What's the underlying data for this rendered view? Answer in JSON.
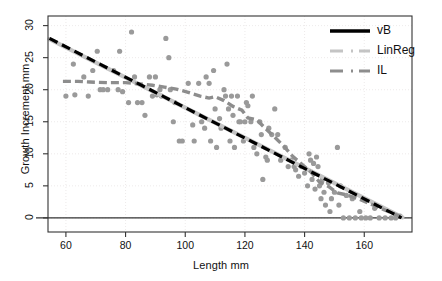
{
  "chart_data": {
    "type": "scatter",
    "title": "",
    "xlabel": "Length mm",
    "ylabel": "Growth Increment mm",
    "xlim": [
      54,
      176
    ],
    "ylim": [
      -2.2,
      31.5
    ],
    "xticks": [
      60,
      80,
      100,
      120,
      140,
      160
    ],
    "yticks": [
      0,
      5,
      10,
      15,
      20,
      25,
      30
    ],
    "grid": true,
    "grid_color": "#e8e4e4",
    "legend_position": "top-right",
    "zero_line": 0,
    "point_color": "#9a9a9a",
    "point_radius": 2.6,
    "legend": [
      {
        "name": "vB",
        "color": "#000000",
        "style": "solid",
        "width": 3.4
      },
      {
        "name": "LinReg",
        "color": "#c4c4c4",
        "style": "dashdot",
        "width": 3.2
      },
      {
        "name": "IL",
        "color": "#8d8d8d",
        "style": "dashdot",
        "width": 3.2
      }
    ],
    "series": [
      {
        "name": "vB",
        "type": "line",
        "color": "#000000",
        "style": "dashed",
        "points": [
          [
            54.5,
            28.0
          ],
          [
            172.5,
            0.0
          ]
        ]
      },
      {
        "name": "LinReg",
        "type": "line",
        "color": "#c4c4c4",
        "style": "solid",
        "points": [
          [
            54.5,
            27.9
          ],
          [
            172.8,
            0.1
          ]
        ]
      },
      {
        "name": "IL",
        "type": "line",
        "color": "#8d8d8d",
        "style": "dashed-step",
        "points": [
          [
            59.0,
            21.3
          ],
          [
            64.0,
            21.3
          ],
          [
            68.0,
            21.2
          ],
          [
            74.0,
            21.1
          ],
          [
            80.0,
            21.1
          ],
          [
            85.0,
            20.9
          ],
          [
            89.0,
            20.7
          ],
          [
            93.0,
            20.4
          ],
          [
            97.0,
            20.1
          ],
          [
            101.0,
            19.6
          ],
          [
            105.0,
            19.0
          ],
          [
            108.0,
            18.7
          ],
          [
            110.0,
            18.9
          ],
          [
            113.0,
            18.3
          ],
          [
            116.0,
            17.4
          ],
          [
            119.0,
            16.8
          ],
          [
            121.0,
            15.6
          ],
          [
            124.0,
            15.3
          ],
          [
            127.0,
            13.9
          ],
          [
            130.0,
            12.6
          ],
          [
            133.0,
            11.2
          ],
          [
            136.0,
            9.6
          ],
          [
            139.0,
            8.4
          ],
          [
            142.0,
            7.2
          ],
          [
            145.0,
            5.6
          ],
          [
            148.0,
            4.9
          ],
          [
            151.0,
            3.9
          ],
          [
            154.0,
            3.6
          ],
          [
            158.0,
            3.0
          ],
          [
            162.0,
            2.2
          ],
          [
            166.0,
            1.4
          ],
          [
            170.0,
            0.6
          ],
          [
            173.0,
            0.1
          ]
        ]
      },
      {
        "name": "observations",
        "type": "scatter",
        "color": "#9a9a9a",
        "points": [
          [
            60.0,
            19.0
          ],
          [
            62.5,
            24.0
          ],
          [
            63.0,
            19.2
          ],
          [
            66.0,
            22.0
          ],
          [
            67.5,
            19.0
          ],
          [
            69.0,
            23.0
          ],
          [
            70.5,
            26.0
          ],
          [
            71.5,
            20.0
          ],
          [
            72.5,
            20.0
          ],
          [
            74.0,
            20.0
          ],
          [
            76.0,
            23.0
          ],
          [
            77.5,
            20.0
          ],
          [
            78.0,
            26.0
          ],
          [
            79.0,
            19.7
          ],
          [
            81.0,
            18.0
          ],
          [
            82.0,
            29.0
          ],
          [
            83.0,
            22.0
          ],
          [
            84.0,
            18.0
          ],
          [
            85.5,
            18.0
          ],
          [
            86.5,
            16.0
          ],
          [
            88.0,
            22.0
          ],
          [
            89.0,
            19.0
          ],
          [
            90.0,
            22.0
          ],
          [
            90.5,
            19.2
          ],
          [
            91.5,
            20.0
          ],
          [
            92.0,
            19.0
          ],
          [
            93.5,
            28.0
          ],
          [
            94.5,
            25.0
          ],
          [
            95.0,
            20.0
          ],
          [
            96.0,
            15.0
          ],
          [
            96.5,
            18.0
          ],
          [
            98.0,
            12.0
          ],
          [
            99.0,
            12.0
          ],
          [
            101.0,
            21.0
          ],
          [
            102.5,
            14.5
          ],
          [
            103.0,
            12.0
          ],
          [
            104.5,
            21.0
          ],
          [
            105.5,
            15.0
          ],
          [
            106.5,
            14.0
          ],
          [
            107.0,
            22.0
          ],
          [
            108.0,
            21.0
          ],
          [
            108.5,
            12.0
          ],
          [
            109.5,
            23.0
          ],
          [
            110.0,
            17.0
          ],
          [
            110.5,
            11.0
          ],
          [
            111.5,
            15.5
          ],
          [
            112.0,
            14.0
          ],
          [
            113.0,
            20.0
          ],
          [
            113.5,
            19.0
          ],
          [
            114.0,
            24.0
          ],
          [
            114.5,
            17.0
          ],
          [
            115.0,
            12.0
          ],
          [
            115.5,
            19.0
          ],
          [
            116.0,
            16.0
          ],
          [
            116.5,
            11.0
          ],
          [
            117.5,
            19.0
          ],
          [
            118.0,
            15.0
          ],
          [
            118.5,
            15.0
          ],
          [
            119.5,
            12.0
          ],
          [
            120.0,
            15.0
          ],
          [
            120.5,
            18.0
          ],
          [
            121.0,
            17.5
          ],
          [
            122.0,
            15.0
          ],
          [
            122.5,
            19.0
          ],
          [
            123.0,
            11.0
          ],
          [
            124.0,
            10.0
          ],
          [
            125.0,
            15.0
          ],
          [
            125.5,
            13.0
          ],
          [
            126.0,
            6.0
          ],
          [
            127.0,
            9.5
          ],
          [
            127.5,
            9.0
          ],
          [
            128.0,
            14.0
          ],
          [
            129.0,
            13.0
          ],
          [
            130.0,
            17.0
          ],
          [
            131.0,
            13.0
          ],
          [
            132.0,
            9.0
          ],
          [
            133.5,
            11.0
          ],
          [
            134.5,
            8.0
          ],
          [
            135.5,
            9.0
          ],
          [
            136.5,
            8.0
          ],
          [
            137.0,
            7.5
          ],
          [
            138.0,
            6.5
          ],
          [
            139.0,
            8.0
          ],
          [
            140.0,
            7.0
          ],
          [
            141.0,
            5.0
          ],
          [
            141.5,
            10.0
          ],
          [
            142.0,
            9.0
          ],
          [
            142.5,
            6.0
          ],
          [
            143.0,
            8.5
          ],
          [
            143.5,
            4.5
          ],
          [
            144.0,
            9.5
          ],
          [
            144.5,
            8.0
          ],
          [
            145.0,
            5.0
          ],
          [
            145.5,
            3.0
          ],
          [
            146.0,
            6.0
          ],
          [
            146.5,
            4.0
          ],
          [
            147.0,
            2.0
          ],
          [
            148.0,
            5.5
          ],
          [
            148.5,
            1.0
          ],
          [
            149.0,
            3.0
          ],
          [
            150.0,
            4.0
          ],
          [
            151.0,
            11.0
          ],
          [
            151.5,
            2.0
          ],
          [
            152.0,
            5.0
          ],
          [
            153.0,
            0.0
          ],
          [
            154.0,
            3.5
          ],
          [
            155.0,
            0.0
          ],
          [
            156.0,
            3.0
          ],
          [
            157.0,
            0.0
          ],
          [
            158.5,
            1.0
          ],
          [
            159.0,
            0.0
          ],
          [
            160.5,
            0.0
          ],
          [
            162.0,
            0.0
          ],
          [
            163.5,
            1.5
          ],
          [
            165.0,
            0.0
          ],
          [
            167.0,
            0.0
          ],
          [
            169.0,
            0.0
          ],
          [
            170.5,
            0.0
          ],
          [
            172.0,
            0.3
          ]
        ]
      }
    ]
  },
  "axes": {
    "x_title": "Length mm",
    "y_title": "Growth Increment mm",
    "x_tick_labels": [
      "60",
      "80",
      "100",
      "120",
      "140",
      "160"
    ],
    "y_tick_labels": [
      "0",
      "5",
      "10",
      "15",
      "20",
      "25",
      "30"
    ]
  },
  "legend_entries": [
    {
      "label": "vB"
    },
    {
      "label": "LinReg"
    },
    {
      "label": "IL"
    }
  ]
}
